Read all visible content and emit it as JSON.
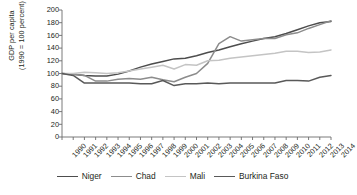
{
  "chart_data": {
    "type": "line",
    "title": "",
    "xlabel": "",
    "ylabel": "GDP per capita (1990 = 100 percent)",
    "ylabel_line1": "GDP per capita",
    "ylabel_line2": "(1990 = 100 percent)",
    "ylim": [
      0,
      200
    ],
    "yticks": [
      200,
      180,
      160,
      140,
      120,
      100,
      80,
      60,
      40,
      20,
      0
    ],
    "grid": false,
    "legend_position": "bottom",
    "x": [
      1990,
      1991,
      1992,
      1993,
      1994,
      1995,
      1996,
      1997,
      1998,
      1999,
      2000,
      2001,
      2002,
      2003,
      2004,
      2005,
      2006,
      2007,
      2008,
      2009,
      2010,
      2011,
      2012,
      2013,
      2014
    ],
    "categories": [
      "1990",
      "1991",
      "1992",
      "1993",
      "1994",
      "1995",
      "1996",
      "1997",
      "1998",
      "1999",
      "2000",
      "2001",
      "2002",
      "2003",
      "2004",
      "2005",
      "2006",
      "2007",
      "2008",
      "2009",
      "2010",
      "2011",
      "2012",
      "2013",
      "2014"
    ],
    "series": [
      {
        "name": "Niger",
        "color": "#4d4d4d",
        "values": [
          100,
          99,
          97,
          96,
          96,
          99,
          104,
          110,
          115,
          119,
          123,
          124,
          128,
          133,
          137,
          142,
          147,
          151,
          155,
          158,
          163,
          169,
          175,
          180,
          182
        ]
      },
      {
        "name": "Chad",
        "color": "#8c8c8c",
        "values": [
          100,
          99,
          97,
          88,
          88,
          91,
          92,
          91,
          94,
          90,
          87,
          94,
          100,
          116,
          147,
          158,
          151,
          153,
          155,
          155,
          161,
          164,
          171,
          177,
          183
        ]
      },
      {
        "name": "Mali",
        "color": "#c4c4c4",
        "values": [
          100,
          100,
          102,
          101,
          100,
          101,
          104,
          107,
          110,
          113,
          107,
          114,
          113,
          120,
          121,
          124,
          126,
          128,
          130,
          132,
          135,
          135,
          133,
          134,
          137
        ]
      },
      {
        "name": "Burkina Faso",
        "color": "#595959",
        "values": [
          100,
          97,
          85,
          85,
          85,
          85,
          85,
          84,
          84,
          89,
          81,
          84,
          84,
          85,
          84,
          85,
          85,
          85,
          85,
          85,
          89,
          89,
          88,
          94,
          97
        ]
      }
    ]
  },
  "legend": {
    "items": [
      {
        "label": "Niger",
        "color": "#4d4d4d"
      },
      {
        "label": "Chad",
        "color": "#8c8c8c"
      },
      {
        "label": "Mali",
        "color": "#c4c4c4"
      },
      {
        "label": "Burkina Faso",
        "color": "#595959"
      }
    ]
  }
}
